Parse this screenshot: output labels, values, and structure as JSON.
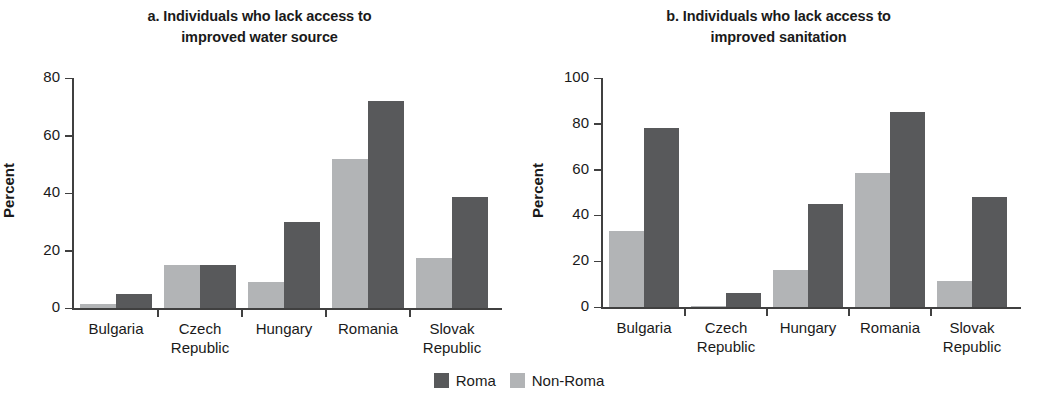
{
  "legend": {
    "items": [
      {
        "label": "Roma",
        "color": "#58595b"
      },
      {
        "label": "Non-Roma",
        "color": "#b2b4b6"
      }
    ]
  },
  "colors": {
    "roma": "#58595b",
    "non_roma": "#b2b4b6",
    "axis": "#404040",
    "text": "#1a1a1a",
    "background": "#ffffff"
  },
  "panels": [
    {
      "id": "panel-a",
      "title_line1": "a. Individuals who lack access to",
      "title_line2": "improved water source",
      "ylabel": "Percent",
      "yticks": [
        "80",
        "60",
        "40",
        "20",
        "0"
      ]
    },
    {
      "id": "panel-b",
      "title_line1": "b. Individuals who lack access to",
      "title_line2": "improved sanitation",
      "ylabel": "Percent",
      "yticks": [
        "100",
        "80",
        "60",
        "40",
        "20",
        "0"
      ]
    }
  ],
  "categories": [
    {
      "line1": "Bulgaria",
      "line2": ""
    },
    {
      "line1": "Czech",
      "line2": "Republic"
    },
    {
      "line1": "Hungary",
      "line2": ""
    },
    {
      "line1": "Romania",
      "line2": ""
    },
    {
      "line1": "Slovak",
      "line2": "Republic"
    }
  ],
  "chart_data": [
    {
      "type": "bar",
      "panel": "a",
      "title": "a. Individuals who lack access to improved water source",
      "xlabel": "",
      "ylabel": "Percent",
      "ylim": [
        0,
        80
      ],
      "yticks": [
        0,
        20,
        40,
        60,
        80
      ],
      "grid": false,
      "legend_position": "bottom-center",
      "categories": [
        "Bulgaria",
        "Czech Republic",
        "Hungary",
        "Romania",
        "Slovak Republic"
      ],
      "series": [
        {
          "name": "Non-Roma",
          "color": "#b2b4b6",
          "values": [
            1.5,
            15,
            9,
            52,
            17.5
          ]
        },
        {
          "name": "Roma",
          "color": "#58595b",
          "values": [
            5,
            15,
            30,
            72,
            38.5
          ]
        }
      ]
    },
    {
      "type": "bar",
      "panel": "b",
      "title": "b. Individuals who lack access to improved sanitation",
      "xlabel": "",
      "ylabel": "Percent",
      "ylim": [
        0,
        100
      ],
      "yticks": [
        0,
        20,
        40,
        60,
        80,
        100
      ],
      "grid": false,
      "legend_position": "bottom-center",
      "categories": [
        "Bulgaria",
        "Czech Republic",
        "Hungary",
        "Romania",
        "Slovak Republic"
      ],
      "series": [
        {
          "name": "Non-Roma",
          "color": "#b2b4b6",
          "values": [
            33,
            0.4,
            16,
            58.5,
            11.5
          ]
        },
        {
          "name": "Roma",
          "color": "#58595b",
          "values": [
            78,
            6,
            45,
            85,
            48
          ]
        }
      ]
    }
  ]
}
